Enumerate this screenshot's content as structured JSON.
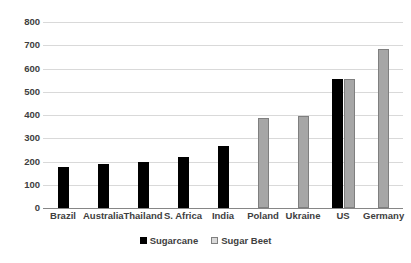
{
  "chart_data": {
    "type": "bar",
    "title": "",
    "subtitle": "",
    "xlabel": "",
    "ylabel": "",
    "ylim": [
      0,
      800
    ],
    "ytick_step": 100,
    "yticks": [
      800,
      700,
      600,
      500,
      400,
      300,
      200,
      100,
      0
    ],
    "ytick_labels": [
      "800",
      "700",
      "600",
      "500",
      "400",
      "300",
      "200",
      "100",
      "0"
    ],
    "grid": true,
    "legend_position": "bottom",
    "categories": [
      "Brazil",
      "Australia",
      "Thailand",
      "S. Africa",
      "India",
      "Poland",
      "Ukraine",
      "US",
      "Germany"
    ],
    "series": [
      {
        "name": "Sugarcane",
        "color": "#000000",
        "values": [
          176,
          188,
          199,
          218,
          267,
          null,
          null,
          555,
          null
        ]
      },
      {
        "name": "Sugar Beet",
        "color": "#a6a6a6",
        "values": [
          null,
          null,
          null,
          null,
          null,
          387,
          395,
          557,
          685
        ]
      }
    ]
  },
  "legend": {
    "items": [
      {
        "label": "Sugarcane",
        "swatch": "filled-black-square"
      },
      {
        "label": "Sugar Beet",
        "swatch": "outlined-gray-square"
      }
    ]
  },
  "colors": {
    "sugarcane": "#000000",
    "sugar_beet": "#a6a6a6",
    "sugar_beet_border": "#7f7f7f",
    "gridline": "#d9d9d9",
    "axis": "#868686",
    "text": "#404040",
    "background": "#ffffff"
  }
}
